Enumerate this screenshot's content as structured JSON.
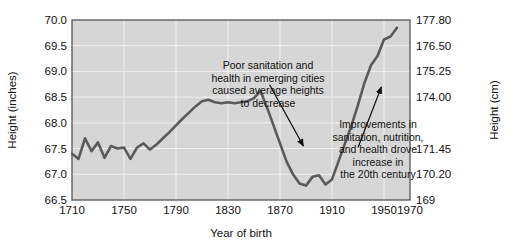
{
  "chart_data": {
    "type": "line",
    "title": "",
    "xlabel": "Year of birth",
    "ylabel": "Height (inches)",
    "ylabel_right": "Height (cm)",
    "xlim": [
      1710,
      1970
    ],
    "ylim": [
      66.5,
      70.0
    ],
    "grid": true,
    "legend": "none",
    "x_ticks": [
      "1710",
      "1750",
      "1790",
      "1830",
      "1870",
      "1910",
      "1950",
      "1970"
    ],
    "x_tick_values": [
      1710,
      1750,
      1790,
      1830,
      1870,
      1910,
      1950,
      1970
    ],
    "y_ticks_left": [
      "66.5",
      "67.0",
      "67.5",
      "68.0",
      "68.5",
      "69.0",
      "69.5",
      "70.0"
    ],
    "y_tick_values_left": [
      66.5,
      67.0,
      67.5,
      68.0,
      68.5,
      69.0,
      69.5,
      70.0
    ],
    "y_ticks_right": [
      "169",
      "170.20",
      "171.45",
      "174.00",
      "175.25",
      "176.50",
      "177.80"
    ],
    "y_tick_positions_right": [
      66.5,
      67.0,
      67.5,
      68.5,
      69.0,
      69.5,
      70.0
    ],
    "series": [
      {
        "name": "Average male height",
        "color": "#5a5a5a",
        "x": [
          1710,
          1715,
          1720,
          1725,
          1730,
          1735,
          1740,
          1745,
          1750,
          1755,
          1760,
          1765,
          1770,
          1775,
          1780,
          1785,
          1790,
          1795,
          1800,
          1805,
          1810,
          1815,
          1820,
          1825,
          1830,
          1835,
          1840,
          1845,
          1850,
          1855,
          1860,
          1865,
          1870,
          1875,
          1880,
          1885,
          1890,
          1895,
          1900,
          1905,
          1910,
          1915,
          1920,
          1925,
          1930,
          1935,
          1940,
          1945,
          1950,
          1955,
          1960
        ],
        "values": [
          67.4,
          67.3,
          67.7,
          67.45,
          67.62,
          67.32,
          67.55,
          67.5,
          67.52,
          67.3,
          67.52,
          67.6,
          67.48,
          67.58,
          67.7,
          67.82,
          67.95,
          68.08,
          68.2,
          68.32,
          68.42,
          68.45,
          68.4,
          68.38,
          68.4,
          68.38,
          68.4,
          68.42,
          68.48,
          68.62,
          68.3,
          67.95,
          67.6,
          67.25,
          67.0,
          66.82,
          66.78,
          66.95,
          66.98,
          66.8,
          66.9,
          67.25,
          67.6,
          67.95,
          68.35,
          68.78,
          69.12,
          69.3,
          69.62,
          69.68,
          69.85
        ]
      }
    ],
    "annotations": [
      {
        "id": "annotation-decline",
        "lines": [
          "Poor sanitation and",
          "health in emerging cities",
          "caused average heights",
          "to decrease"
        ],
        "arrow_from": [
          1862,
          68.74
        ],
        "arrow_to": [
          1888,
          67.55
        ]
      },
      {
        "id": "annotation-increase",
        "lines": [
          "Improvements in",
          "sanitation, nutrition,",
          "and health drove",
          "increase in",
          "the 20th century"
        ],
        "arrow_from": [
          1930,
          67.52
        ],
        "arrow_to": [
          1948,
          68.7
        ]
      }
    ],
    "colors": {
      "plot_background": "#d6d6d6",
      "gridline": "#f0f0f0",
      "plot_border": "#555555",
      "line": "#5a5a5a",
      "text": "#111111",
      "page_background": "#ffffff"
    }
  }
}
